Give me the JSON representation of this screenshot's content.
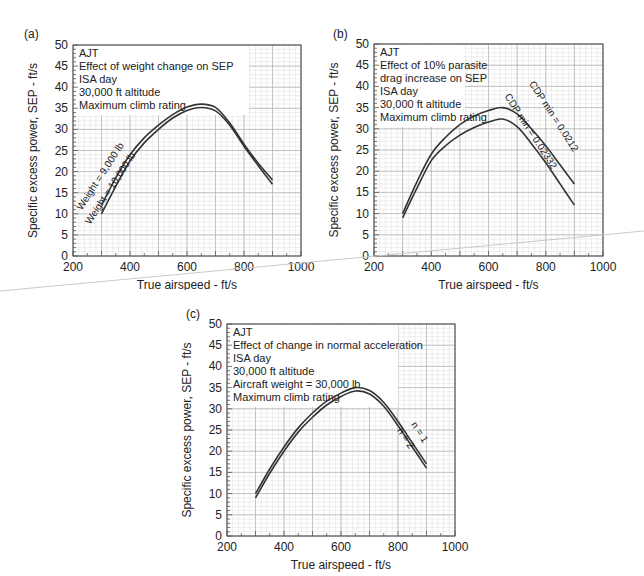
{
  "chart_data": [
    {
      "panel_label": "(a)",
      "type": "line",
      "title": "AJT",
      "annotations": [
        "AJT",
        "Effect of weight change on SEP",
        "ISA day",
        "30,000 ft altitude",
        "Maximum climb rating"
      ],
      "xlabel": "True airspeed - ft/s",
      "ylabel": "Specific excess power, SEP - ft/s",
      "xlim": [
        200,
        1000
      ],
      "ylim": [
        0,
        50
      ],
      "xticks": [
        200,
        400,
        600,
        800,
        1000
      ],
      "yticks": [
        0,
        5,
        10,
        15,
        20,
        25,
        30,
        35,
        40,
        45,
        50
      ],
      "grid": true,
      "x": [
        300,
        350,
        400,
        450,
        500,
        550,
        600,
        650,
        700,
        750,
        800,
        850,
        900
      ],
      "series": [
        {
          "name": "Weight = 9,000 lb",
          "values": [
            12,
            18.5,
            24,
            28,
            31,
            33.5,
            35.3,
            36,
            35.2,
            31.5,
            26.5,
            22,
            18
          ]
        },
        {
          "name": "Weight = 10,000 lb",
          "values": [
            10,
            16.5,
            22.5,
            26.8,
            30,
            32.7,
            34.5,
            35.2,
            34.4,
            31,
            26,
            21.4,
            17
          ]
        }
      ]
    },
    {
      "panel_label": "(b)",
      "type": "line",
      "title": "AJT",
      "annotations": [
        "AJT",
        "Effect of 10% parasite",
        "drag increase on SEP",
        "ISA day",
        "30,000 ft altitude",
        "Maximum climb rating"
      ],
      "xlabel": "True airspeed - ft/s",
      "ylabel": "Specific excess power, SEP - ft/s",
      "xlim": [
        200,
        1000
      ],
      "ylim": [
        0,
        50
      ],
      "xticks": [
        200,
        400,
        600,
        800,
        1000
      ],
      "yticks": [
        0,
        5,
        10,
        15,
        20,
        25,
        30,
        35,
        40,
        45,
        50
      ],
      "grid": true,
      "x": [
        300,
        350,
        400,
        450,
        500,
        550,
        600,
        650,
        700,
        750,
        800,
        850,
        900
      ],
      "series": [
        {
          "name": "CDP min = 0.0212",
          "values": [
            10,
            17.5,
            24,
            28,
            31,
            33,
            34.3,
            35,
            33.5,
            30,
            26,
            21.5,
            17
          ]
        },
        {
          "name": "CDP min = 0.02332",
          "values": [
            9,
            16,
            22.5,
            26,
            28.5,
            30.3,
            31.6,
            32.3,
            30.5,
            26.5,
            22,
            17,
            12
          ]
        }
      ]
    },
    {
      "panel_label": "(c)",
      "type": "line",
      "title": "AJT",
      "annotations": [
        "AJT",
        "Effect of change in normal acceleration",
        "ISA day",
        "30,000 ft altitude",
        "Aircraft weight = 30,000 lb",
        "Maximum climb rating"
      ],
      "xlabel": "True airspeed - ft/s",
      "ylabel": "Specific excess power, SEP - ft/s",
      "xlim": [
        200,
        1000
      ],
      "ylim": [
        0,
        50
      ],
      "xticks": [
        200,
        400,
        600,
        800,
        1000
      ],
      "yticks": [
        0,
        5,
        10,
        15,
        20,
        25,
        30,
        35,
        40,
        45,
        50
      ],
      "grid": true,
      "x": [
        300,
        350,
        400,
        450,
        500,
        550,
        600,
        650,
        700,
        750,
        800,
        850,
        900
      ],
      "series": [
        {
          "name": "n = 1",
          "values": [
            10,
            15.8,
            21,
            25.5,
            29,
            31.8,
            33.7,
            35,
            34.3,
            31.5,
            27,
            22,
            17
          ]
        },
        {
          "name": "n = 2",
          "values": [
            9,
            14.8,
            20,
            24.5,
            28,
            30.9,
            32.9,
            34.2,
            33.5,
            30.6,
            26,
            21,
            16
          ]
        }
      ]
    }
  ],
  "panels": [
    {
      "label": "(a)",
      "lines": [
        "AJT",
        "Effect of weight change on SEP",
        "ISA day",
        "30,000 ft altitude",
        "Maximum climb rating"
      ],
      "curve_labels": [
        "Weight = 9,000 lb",
        "Weight = 10,000 lb"
      ]
    },
    {
      "label": "(b)",
      "lines": [
        "AJT",
        "Effect of 10% parasite",
        "drag increase on SEP",
        "ISA day",
        "30,000 ft altitude",
        "Maximum climb rating"
      ],
      "curve_labels": [
        "CDP min = 0.0212",
        "CDP min = 0.02332"
      ]
    },
    {
      "label": "(c)",
      "lines": [
        "AJT",
        "Effect of change in normal acceleration",
        "ISA day",
        "30,000 ft altitude",
        "Aircraft weight = 30,000 lb",
        "Maximum climb rating"
      ],
      "curve_labels": [
        "n = 1",
        "n = 2"
      ]
    }
  ],
  "axes": {
    "xlabel": "True airspeed - ft/s",
    "ylabel": "Specific excess power, SEP - ft/s",
    "xticks": [
      "200",
      "400",
      "600",
      "800",
      "1000"
    ],
    "yticks": [
      "0",
      "5",
      "10",
      "15",
      "20",
      "25",
      "30",
      "35",
      "40",
      "45",
      "50"
    ]
  },
  "colors": {
    "curve": "#333333",
    "grid_major": "#b8b8b8",
    "grid_minor": "#e2e2e2",
    "frame": "#444444"
  }
}
